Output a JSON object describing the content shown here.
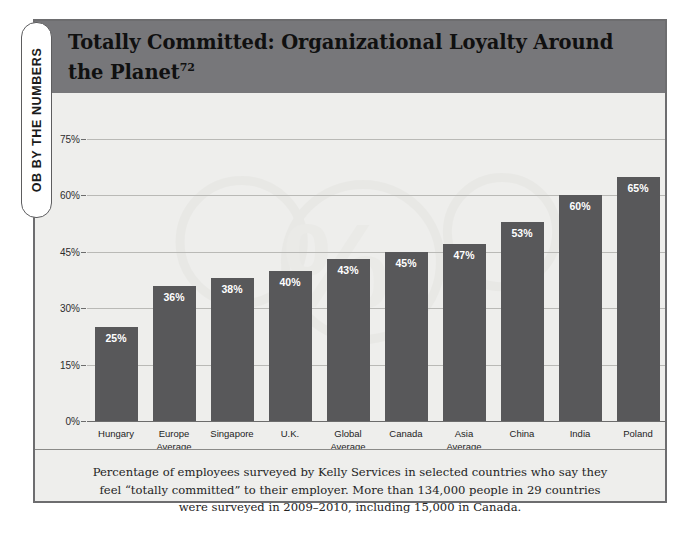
{
  "side_tab": {
    "label": "OB BY THE NUMBERS"
  },
  "header": {
    "title": "Totally Committed: Organizational Loyalty Around the Planet",
    "footnote_marker": "72"
  },
  "caption": {
    "text": "Percentage of employees surveyed by Kelly Services in selected countries who say they feel “totally committed” to their employer. More than 134,000 people in 29 countries were surveyed in 2009–2010, including 15,000 in Canada."
  },
  "colors": {
    "bar": "#58585a",
    "header_band": "#77777a",
    "panel": "#eeeeec",
    "gridline": "#b9b9b6",
    "axis": "#6c6c6c",
    "frame_border": "#6d6d6f",
    "value_label": "#ffffff"
  },
  "chart_data": {
    "type": "bar",
    "title": "Totally Committed: Organizational Loyalty Around the Planet",
    "xlabel": "",
    "ylabel": "",
    "ylim": [
      0,
      75
    ],
    "grid": true,
    "legend": "none",
    "orientation": "vertical",
    "categories": [
      "Hungary",
      "Europe Average",
      "Singapore",
      "U.K.",
      "Global Average",
      "Canada",
      "Asia Average",
      "China",
      "India",
      "Poland"
    ],
    "category_lines": [
      [
        "Hungary"
      ],
      [
        "Europe",
        "Average"
      ],
      [
        "Singapore"
      ],
      [
        "U.K."
      ],
      [
        "Global",
        "Average"
      ],
      [
        "Canada"
      ],
      [
        "Asia",
        "Average"
      ],
      [
        "China"
      ],
      [
        "India"
      ],
      [
        "Poland"
      ]
    ],
    "values": [
      25,
      36,
      38,
      40,
      43,
      45,
      47,
      53,
      60,
      65
    ],
    "value_labels": [
      "25%",
      "36%",
      "38%",
      "40%",
      "43%",
      "45%",
      "47%",
      "53%",
      "60%",
      "65%"
    ],
    "yticks": [
      0,
      15,
      30,
      45,
      60,
      75
    ],
    "ytick_labels": [
      "0%",
      "15%",
      "30%",
      "45%",
      "60%",
      "75%"
    ]
  }
}
